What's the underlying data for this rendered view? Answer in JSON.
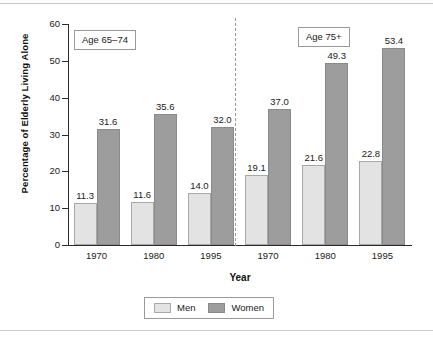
{
  "chart_data": {
    "type": "bar",
    "title": "",
    "xlabel": "Year",
    "ylabel": "Percentage of Elderly Living Alone",
    "ylim": [
      0,
      60
    ],
    "yticks": [
      0,
      10,
      20,
      30,
      40,
      50,
      60
    ],
    "ytick_labels": [
      "0",
      "10",
      "20",
      "30",
      "40",
      "50",
      "60"
    ],
    "grid": false,
    "legend_position": "bottom-center",
    "legend": [
      "Men",
      "Women"
    ],
    "colors": {
      "men": "#e3e3e3",
      "women": "#9d9d9d",
      "axis": "#2b2b2b",
      "divider": "#9a9a9a",
      "frame": "#c9c9c9"
    },
    "panels": [
      {
        "label": "Age 65–74",
        "categories": [
          "1970",
          "1980",
          "1995"
        ],
        "series": [
          {
            "name": "Men",
            "values": [
              11.3,
              11.6,
              14.0
            ],
            "labels": [
              "11.3",
              "11.6",
              "14.0"
            ]
          },
          {
            "name": "Women",
            "values": [
              31.6,
              35.6,
              32.0
            ],
            "labels": [
              "31.6",
              "35.6",
              "32.0"
            ]
          }
        ]
      },
      {
        "label": "Age 75+",
        "categories": [
          "1970",
          "1980",
          "1995"
        ],
        "series": [
          {
            "name": "Men",
            "values": [
              19.1,
              21.6,
              22.8
            ],
            "labels": [
              "19.1",
              "21.6",
              "22.8"
            ]
          },
          {
            "name": "Women",
            "values": [
              37.0,
              49.3,
              53.4
            ],
            "labels": [
              "37.0",
              "49.3",
              "53.4"
            ]
          }
        ]
      }
    ],
    "annotations": [
      {
        "text": "Age 65–74",
        "kind": "panel-box"
      },
      {
        "text": "Age 75+",
        "kind": "panel-box"
      }
    ]
  }
}
